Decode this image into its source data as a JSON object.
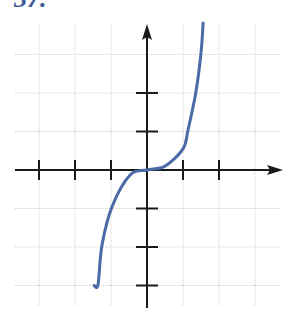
{
  "problem_label": "37.",
  "colors": {
    "curve": "#4a6aa8",
    "axis": "#1a1a1a",
    "grid": "#cfcfcf",
    "label": "#3a5a9a"
  },
  "chart_data": {
    "type": "line",
    "title": "",
    "xlabel": "",
    "ylabel": "",
    "grid": true,
    "axis_arrows": {
      "x_positive": true,
      "y_positive": true
    },
    "xlim": [
      -3.5,
      3.8
    ],
    "ylim": [
      -3.6,
      3.8
    ],
    "x_ticks": [
      -3,
      -2,
      -1,
      1,
      2
    ],
    "y_ticks": [
      -3,
      -2,
      -1,
      1,
      2
    ],
    "tick_labels_shown": false,
    "series": [
      {
        "name": "curve",
        "description": "cubic-like curve through origin, increasing, flat at origin",
        "x": [
          -1.47,
          -1.36,
          -1.25,
          -0.97,
          -0.47,
          0,
          0.5,
          1.0,
          1.14,
          1.36,
          1.5,
          1.56
        ],
        "y": [
          -3.0,
          -2.97,
          -1.95,
          -0.95,
          -0.13,
          0,
          0.1,
          0.55,
          1.04,
          2.03,
          3.04,
          3.82
        ]
      }
    ]
  }
}
